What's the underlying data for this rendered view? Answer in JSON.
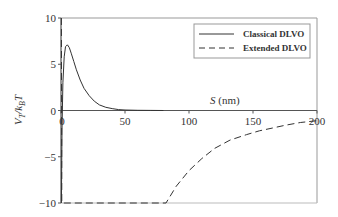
{
  "chart_data": {
    "type": "line",
    "title": "",
    "xlabel": "S (nm)",
    "xlabel_parts": {
      "var": "S",
      "unit": " (nm)"
    },
    "ylabel": "V_T/k_B T",
    "ylabel_parts": {
      "v": "V",
      "vsub": "T",
      "slash": "/k",
      "ksub": "B",
      "t": "T"
    },
    "xlim": [
      0,
      200
    ],
    "ylim": [
      -10,
      10
    ],
    "xticks": [
      0,
      50,
      100,
      150,
      200
    ],
    "xtick_labels": [
      "0",
      "50",
      "100",
      "150",
      "200"
    ],
    "yticks": [
      -10,
      -5,
      0,
      5,
      10
    ],
    "ytick_labels": [
      "-10",
      "-5",
      "0",
      "5",
      "10"
    ],
    "grid": false,
    "legend_position": "top-right",
    "series": [
      {
        "name": "Classical DLVO",
        "style": "solid",
        "color": "#333333",
        "x": [
          0.3,
          0.8,
          1.5,
          2.5,
          3.5,
          5,
          6.5,
          8,
          10,
          12,
          15,
          18,
          22,
          26,
          30,
          35,
          40,
          45,
          50,
          60,
          70,
          80
        ],
        "y": [
          -10,
          -2,
          3,
          5.8,
          6.9,
          7.1,
          6.8,
          6.2,
          5.3,
          4.4,
          3.3,
          2.4,
          1.6,
          1.0,
          0.6,
          0.35,
          0.2,
          0.1,
          0.05,
          0.02,
          0.01,
          0
        ]
      },
      {
        "name": "Extended DLVO",
        "style": "dashed",
        "color": "#333333",
        "x": [
          0.3,
          0.6,
          82,
          90,
          100,
          110,
          120,
          132,
          145,
          155,
          165,
          175,
          187,
          200
        ],
        "y": [
          10,
          -10,
          -10,
          -8.2,
          -6.5,
          -5.2,
          -4.1,
          -3.2,
          -2.6,
          -2.2,
          -1.9,
          -1.6,
          -1.3,
          -1.1
        ]
      }
    ]
  }
}
